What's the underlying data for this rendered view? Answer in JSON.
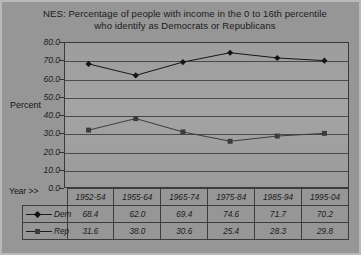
{
  "chart_data": {
    "type": "line",
    "title": "NES:  Percentage of people with income in the 0 to 16th percentile who identify as Democrats or Republicans",
    "title_line_1": "NES:  Percentage of people with income in the 0 to 16th percentile",
    "title_line_2": "who identify as Democrats or Republicans",
    "xlabel": "Year >>",
    "ylabel": "Percent",
    "ylim": [
      0,
      80
    ],
    "yticks": [
      "0.0",
      "10.0",
      "20.0",
      "30.0",
      "40.0",
      "50.0",
      "60.0",
      "70.0",
      "80.0"
    ],
    "ytick_values": [
      0,
      10,
      20,
      30,
      40,
      50,
      60,
      70,
      80
    ],
    "grid": true,
    "legend_position": "table-left",
    "categories": [
      "1952-54",
      "1955-64",
      "1965-74",
      "1975-84",
      "1985-94",
      "1995-04"
    ],
    "series": [
      {
        "name": "Dem",
        "marker": "diamond",
        "color": "#141414",
        "values": [
          68.4,
          62.0,
          69.4,
          74.6,
          71.7,
          70.2
        ],
        "labels": [
          "68.4",
          "62.0",
          "69.4",
          "74.6",
          "71.7",
          "70.2"
        ]
      },
      {
        "name": "Rep",
        "marker": "square",
        "color": "#3b3b3b",
        "values": [
          31.6,
          38.0,
          30.6,
          25.4,
          28.3,
          29.8
        ],
        "labels": [
          "31.6",
          "38.0",
          "30.6",
          "25.4",
          "28.3",
          "29.8"
        ]
      }
    ]
  },
  "colors": {
    "background": "#969696",
    "plot_background": "#a1a1a1",
    "gridline": "#4a4a4a",
    "axis": "#333333",
    "text": "#1a1a1a",
    "dem_series": "#141414",
    "rep_series": "#3b3b3b"
  }
}
